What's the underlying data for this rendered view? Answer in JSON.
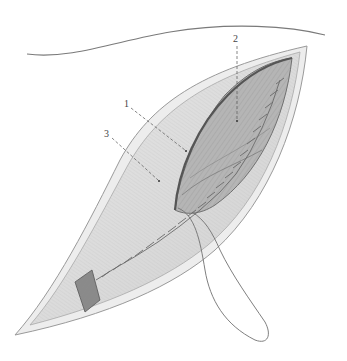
{
  "figure": {
    "labels": [
      {
        "id": "1",
        "text": "1",
        "x": 124,
        "y": 101
      },
      {
        "id": "2",
        "text": "2",
        "x": 234,
        "y": 36
      },
      {
        "id": "3",
        "text": "3",
        "x": 106,
        "y": 131
      }
    ],
    "colors": {
      "background": "#ffffff",
      "skin_outline": "#8a8a8a",
      "skin_edge": "#c8c8c8",
      "muscle_fill": "#a9a9a9",
      "muscle_dark": "#6f6f6f",
      "fascia_fill": "#dcdcdc",
      "suture": "#6a6a6a"
    }
  }
}
